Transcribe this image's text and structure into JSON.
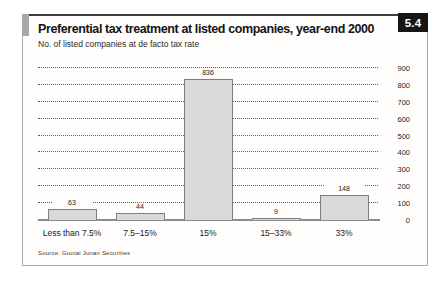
{
  "figure": {
    "number": "5.4",
    "title": "Preferential tax treatment at listed companies, year-end 2000",
    "subtitle": "No. of listed companies at de facto tax rate",
    "source": "Source: Guotai Junan Securities"
  },
  "colors": {
    "bar_fill": "#d9d9d9",
    "bar_border": "#7f7f7f",
    "badge_bg": "#161616",
    "badge_text": "#ffffff",
    "accent_square": "#a8a8a8",
    "gridline": "#606060",
    "baseline": "#8c8c8c"
  },
  "chart_data": {
    "type": "bar",
    "title": "Preferential tax treatment at listed companies, year-end 2000",
    "subtitle": "No. of listed companies at de facto tax rate",
    "categories": [
      "Less than 7.5%",
      "7.5–15%",
      "15%",
      "15–33%",
      "33%"
    ],
    "values": [
      63,
      44,
      836,
      9,
      148
    ],
    "value_labels": [
      63,
      44,
      836,
      9,
      148
    ],
    "xlabel": "",
    "ylabel": "",
    "ylim": [
      0,
      900
    ],
    "yticks": [
      0,
      100,
      200,
      300,
      400,
      500,
      600,
      700,
      800,
      900
    ],
    "grid": "horizontal-dotted",
    "legend": "none",
    "y_axis_side": "right"
  }
}
